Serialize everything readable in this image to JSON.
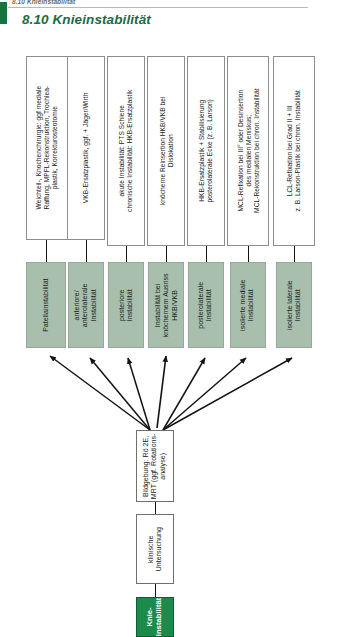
{
  "page": {
    "running_head": "8.10 Knieinstabilität",
    "section_number_title": "8.10  Knieinstabilität",
    "language": "de",
    "orientation": "rotated-90-landscape-on-portrait-page",
    "colors": {
      "section_title_green": "#1d6b42",
      "start_node_green": "#1b8a4b",
      "instability_box_green": "#a9bfae",
      "box_border_grey": "#8d8d8d",
      "connector_black": "#141414",
      "page_background": "#ffffff"
    }
  },
  "flow": {
    "direction": "bottom-to-top (reads right-to-left when page is rotated)",
    "start": {
      "id": "start",
      "label": "Knie-\ninstabilität",
      "type": "start-node"
    },
    "diagnostics": [
      {
        "id": "clinical-exam",
        "label": "klinische\nUntersuchung",
        "type": "diagnostic-step"
      },
      {
        "id": "imaging",
        "label": "Bildgebung: Rö 2E,\nMRT (ggf. Rotations-\nanalyse)",
        "type": "diagnostic-step"
      }
    ],
    "branches": [
      {
        "id": "patella",
        "instability": "Patellainstabilität",
        "treatment": "Weichteil-, Knochenchirurgie: ggf mediale\nRaffung, MPFL-Rekonstruktion, Trochlea-\nplastik, Korrekturosteotomie"
      },
      {
        "id": "anterior",
        "instability": "anteriore/\nanterolaterale\nInstabilität",
        "treatment": "VKB-Ersatzplastik, ggf. + Jäger/Wirth"
      },
      {
        "id": "posterior",
        "instability": "posteriore\nInstabilität",
        "treatment": "akute Instabilität: PTS Schiene\nchronische Instabilität: HKB-Ersatzplastik"
      },
      {
        "id": "bony-avulsion",
        "instability": "Instabilität bei\nknöchernem Ausriss\nHKB/VKB",
        "treatment": "knöcherne Reinsertion HKB/VKB bei\nDislokation"
      },
      {
        "id": "posterolateral",
        "instability": "posterolaterale\nInstabilität",
        "treatment": "HKB-Ersatzplastik + Stabilisierung\nposterolaterale Ecke (z. B. Larson)"
      },
      {
        "id": "medial",
        "instability": "isolierte mediale\nInstabilität",
        "treatment": "MCL-Refixation bei III° oder Desinsertion\ndes medialen Meniskus;\nMCL-Rekonstruktion bei chron. Instabilität"
      },
      {
        "id": "lateral",
        "instability": "isolierte laterale\nInstabilität",
        "treatment": "LCL-Refixation bei Grad II + III\nz. B. Larson-Plastik bei chron. Instabilität"
      }
    ]
  }
}
